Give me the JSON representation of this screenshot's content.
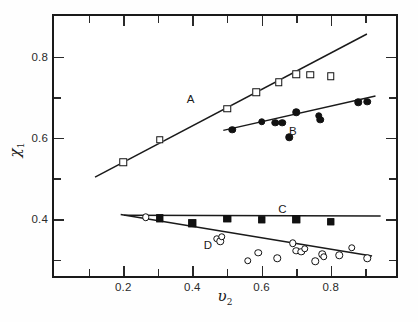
{
  "chart_data": {
    "type": "scatter",
    "title": "",
    "xlabel": "v2",
    "ylabel": "chi 1",
    "xlabel_display": "υ",
    "xlabel_sub": "2",
    "ylabel_display": "χ",
    "ylabel_sub": "1",
    "xlim": [
      0.0,
      1.0
    ],
    "ylim": [
      0.25,
      0.9
    ],
    "grid": false,
    "legend_position": "inline-annotations",
    "xticks_major": [
      0.2,
      0.4,
      0.6,
      0.8
    ],
    "xtick_labels": [
      "0.2",
      "0.4",
      "0.6",
      "0.8"
    ],
    "xticks_minor": [
      0.1,
      0.3,
      0.5,
      0.7,
      0.9
    ],
    "yticks_major": [
      0.4,
      0.6,
      0.8
    ],
    "ytick_labels": [
      "0.4",
      "0.6",
      "0.8"
    ],
    "yticks_minor": [
      0.3,
      0.5,
      0.7
    ],
    "series": [
      {
        "name": "A",
        "label": "A",
        "marker": "open-square",
        "label_x": 0.395,
        "label_y": 0.695,
        "fit_line": {
          "x1": 0.12,
          "y1": 0.497,
          "x2": 0.915,
          "y2": 0.855
        },
        "points": [
          {
            "x": 0.2,
            "y": 0.54
          },
          {
            "x": 0.305,
            "y": 0.595
          },
          {
            "x": 0.5,
            "y": 0.672
          },
          {
            "x": 0.585,
            "y": 0.712
          },
          {
            "x": 0.65,
            "y": 0.737
          },
          {
            "x": 0.7,
            "y": 0.756
          },
          {
            "x": 0.74,
            "y": 0.755
          },
          {
            "x": 0.8,
            "y": 0.752
          }
        ]
      },
      {
        "name": "B",
        "label": "B",
        "marker": "filled-circle",
        "label_x": 0.69,
        "label_y": 0.617,
        "fit_line": {
          "x1": 0.495,
          "y1": 0.614,
          "x2": 0.94,
          "y2": 0.7
        },
        "points": [
          {
            "x": 0.515,
            "y": 0.62
          },
          {
            "x": 0.6,
            "y": 0.64
          },
          {
            "x": 0.64,
            "y": 0.637
          },
          {
            "x": 0.66,
            "y": 0.637
          },
          {
            "x": 0.68,
            "y": 0.601
          },
          {
            "x": 0.7,
            "y": 0.663
          },
          {
            "x": 0.765,
            "y": 0.655
          },
          {
            "x": 0.77,
            "y": 0.644
          },
          {
            "x": 0.88,
            "y": 0.688
          },
          {
            "x": 0.905,
            "y": 0.689
          }
        ]
      },
      {
        "name": "C",
        "label": "C",
        "marker": "filled-square",
        "label_x": 0.66,
        "label_y": 0.424,
        "fit_line": {
          "x1": 0.205,
          "y1": 0.402,
          "x2": 0.955,
          "y2": 0.4
        },
        "points": [
          {
            "x": 0.305,
            "y": 0.402
          },
          {
            "x": 0.4,
            "y": 0.39
          },
          {
            "x": 0.5,
            "y": 0.401
          },
          {
            "x": 0.6,
            "y": 0.398
          },
          {
            "x": 0.7,
            "y": 0.399
          },
          {
            "x": 0.8,
            "y": 0.393
          }
        ]
      },
      {
        "name": "D",
        "label": "D",
        "marker": "open-circle",
        "label_x": 0.445,
        "label_y": 0.337,
        "fit_line": {
          "x1": 0.195,
          "y1": 0.404,
          "x2": 0.93,
          "y2": 0.3
        },
        "points": [
          {
            "x": 0.265,
            "y": 0.405
          },
          {
            "x": 0.47,
            "y": 0.352
          },
          {
            "x": 0.48,
            "y": 0.345
          },
          {
            "x": 0.485,
            "y": 0.356
          },
          {
            "x": 0.56,
            "y": 0.297
          },
          {
            "x": 0.59,
            "y": 0.317
          },
          {
            "x": 0.645,
            "y": 0.303
          },
          {
            "x": 0.69,
            "y": 0.34
          },
          {
            "x": 0.7,
            "y": 0.322
          },
          {
            "x": 0.715,
            "y": 0.319
          },
          {
            "x": 0.725,
            "y": 0.327
          },
          {
            "x": 0.755,
            "y": 0.296
          },
          {
            "x": 0.775,
            "y": 0.313
          },
          {
            "x": 0.78,
            "y": 0.307
          },
          {
            "x": 0.825,
            "y": 0.311
          },
          {
            "x": 0.86,
            "y": 0.33
          },
          {
            "x": 0.905,
            "y": 0.303
          }
        ]
      }
    ]
  },
  "colors": {
    "axis": "#1a1a1a",
    "marker_stroke": "#111111",
    "marker_fill_open": "#ffffff",
    "marker_fill_solid": "#111111",
    "background": "#ffffff"
  }
}
